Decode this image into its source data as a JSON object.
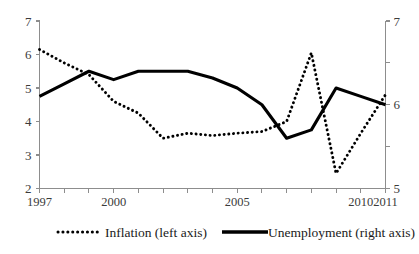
{
  "chart_data": {
    "type": "line",
    "title": "",
    "subtitle": "",
    "xlabel": "",
    "ylabel": "",
    "grid": false,
    "legend_position": "bottom",
    "x": [
      1997,
      1998,
      1999,
      2000,
      2001,
      2002,
      2003,
      2004,
      2005,
      2006,
      2007,
      2008,
      2009,
      2010,
      2011
    ],
    "x_tick_labels": [
      "1997",
      "",
      "",
      "2000",
      "",
      "",
      "",
      "",
      "2005",
      "",
      "",
      "",
      "",
      "2010",
      "2011"
    ],
    "x_axis_labels_shown": [
      "1997",
      "2000",
      "2005",
      "2010",
      "2011"
    ],
    "xlim": [
      1997,
      2011
    ],
    "left_axis": {
      "name": "Inflation (left axis)",
      "ylim": [
        2,
        7
      ],
      "ticks": [
        2,
        3,
        4,
        5,
        6,
        7
      ],
      "tick_labels": [
        "2",
        "3",
        "4",
        "5",
        "6",
        "7"
      ]
    },
    "right_axis": {
      "name": "Unemployment (right axis)",
      "ylim": [
        5,
        7
      ],
      "ticks": [
        5,
        5.5,
        6,
        6.5,
        7
      ],
      "tick_labels": [
        "5",
        "",
        "6",
        "",
        "7"
      ],
      "labeled_ticks": [
        5,
        6,
        7
      ]
    },
    "series": [
      {
        "name": "Inflation (left axis)",
        "axis": "left",
        "style": "dotted",
        "color": "#000000",
        "values": [
          6.15,
          5.75,
          5.4,
          4.6,
          4.25,
          3.5,
          3.65,
          3.58,
          3.65,
          3.7,
          4.0,
          6.05,
          2.45,
          3.65,
          4.8
        ]
      },
      {
        "name": "Unemployment (right axis)",
        "axis": "right",
        "style": "solid",
        "color": "#000000",
        "values": [
          6.1,
          6.25,
          6.4,
          6.3,
          6.4,
          6.4,
          6.4,
          6.32,
          6.2,
          6.0,
          5.6,
          5.7,
          6.2,
          6.1,
          6.0
        ],
        "values_on_left_scale": [
          4.75,
          5.12,
          5.5,
          5.25,
          5.5,
          5.5,
          5.5,
          5.38,
          5.0,
          4.5,
          3.0,
          3.25,
          5.0,
          4.75,
          4.5
        ]
      }
    ],
    "legend": [
      {
        "label": "Inflation (left axis)",
        "style": "dotted"
      },
      {
        "label": "Unemployment (right axis)",
        "style": "solid"
      }
    ]
  }
}
